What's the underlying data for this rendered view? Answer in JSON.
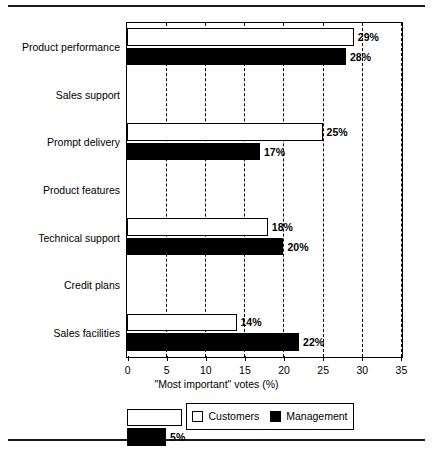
{
  "chart_data": {
    "type": "bar",
    "orientation": "horizontal",
    "title": "",
    "xlabel": "\"Most important\" votes (%)",
    "ylabel": "",
    "xlim": [
      0,
      35
    ],
    "xticks": [
      "0",
      "5",
      "10",
      "15",
      "20",
      "25",
      "30",
      "35"
    ],
    "xtick_values": [
      0,
      5,
      10,
      15,
      20,
      25,
      30,
      35
    ],
    "grid": "vertical-dashed",
    "legend_position": "below-axes",
    "categories": [
      "Product  performance",
      "Sales support",
      "Prompt delivery",
      "Product features",
      "Technical support",
      "Credit plans",
      "Sales facilities"
    ],
    "series": [
      {
        "name": "Customers",
        "color": "#ffffff",
        "edge_color": "#000000",
        "values": [
          29,
          25,
          18,
          14,
          7,
          4,
          3
        ],
        "labels": [
          "29%",
          "25%",
          "18%",
          "14%",
          "7%",
          "4%",
          "3%"
        ]
      },
      {
        "name": "Management",
        "color": "#000000",
        "edge_color": "#000000",
        "values": [
          28,
          17,
          20,
          22,
          5,
          7,
          1
        ],
        "labels": [
          "28%",
          "17%",
          "20%",
          "22%",
          "5%",
          "7 %",
          "1%"
        ]
      }
    ]
  },
  "legend": {
    "entries": [
      {
        "label": "Customers",
        "swatch": "white-square-icon"
      },
      {
        "label": "Management",
        "swatch": "black-square-icon"
      }
    ]
  },
  "rules": {
    "top": "horizontal-rule",
    "bottom": "horizontal-rule"
  }
}
